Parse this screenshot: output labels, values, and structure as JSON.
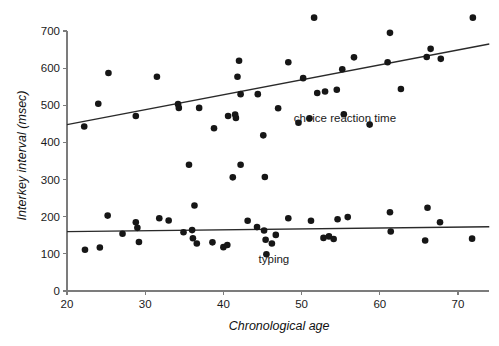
{
  "chart_data": {
    "type": "scatter",
    "title": "",
    "xlabel": "Chronological age",
    "ylabel": "Interkey interval (msec)",
    "xlim": [
      20,
      74
    ],
    "ylim": [
      0,
      730
    ],
    "grid": false,
    "legend_position": "inline-annotation",
    "xticks": [
      20,
      30,
      40,
      50,
      60,
      70
    ],
    "xtick_labels": [
      "20",
      "30",
      "40",
      "50",
      "60",
      "70"
    ],
    "yticks": [
      0,
      100,
      200,
      300,
      400,
      500,
      600,
      700
    ],
    "ytick_labels": [
      "0",
      "100",
      "200",
      "300",
      "400",
      "500",
      "600",
      "700"
    ],
    "annotations": [
      {
        "text": "choice reaction time",
        "x": 49.0,
        "y": 455
      },
      {
        "text": "typing",
        "x": 44.5,
        "y": 75
      }
    ],
    "series": [
      {
        "name": "choice reaction time",
        "label": "choice reaction time",
        "color": "#161616",
        "marker": "circle",
        "trendline": {
          "x0": 20,
          "y0": 448,
          "x1": 74,
          "y1": 665
        },
        "points": [
          {
            "x": 22.2,
            "y": 443
          },
          {
            "x": 24.0,
            "y": 504
          },
          {
            "x": 25.3,
            "y": 587
          },
          {
            "x": 28.8,
            "y": 471
          },
          {
            "x": 31.5,
            "y": 577
          },
          {
            "x": 34.2,
            "y": 503
          },
          {
            "x": 34.3,
            "y": 493
          },
          {
            "x": 36.9,
            "y": 493
          },
          {
            "x": 38.8,
            "y": 438
          },
          {
            "x": 40.6,
            "y": 471
          },
          {
            "x": 41.5,
            "y": 475
          },
          {
            "x": 41.6,
            "y": 466
          },
          {
            "x": 41.8,
            "y": 577
          },
          {
            "x": 42.0,
            "y": 620
          },
          {
            "x": 42.2,
            "y": 530
          },
          {
            "x": 42.2,
            "y": 340
          },
          {
            "x": 44.4,
            "y": 530
          },
          {
            "x": 45.1,
            "y": 419
          },
          {
            "x": 45.3,
            "y": 307
          },
          {
            "x": 47.0,
            "y": 492
          },
          {
            "x": 48.3,
            "y": 616
          },
          {
            "x": 49.6,
            "y": 453
          },
          {
            "x": 50.2,
            "y": 573
          },
          {
            "x": 51.0,
            "y": 465
          },
          {
            "x": 51.6,
            "y": 736
          },
          {
            "x": 52.0,
            "y": 533
          },
          {
            "x": 53.0,
            "y": 537
          },
          {
            "x": 54.5,
            "y": 542
          },
          {
            "x": 55.2,
            "y": 597
          },
          {
            "x": 55.4,
            "y": 476
          },
          {
            "x": 56.7,
            "y": 629
          },
          {
            "x": 58.7,
            "y": 448
          },
          {
            "x": 61.0,
            "y": 616
          },
          {
            "x": 61.3,
            "y": 695
          },
          {
            "x": 62.7,
            "y": 544
          },
          {
            "x": 66.0,
            "y": 630
          },
          {
            "x": 66.5,
            "y": 652
          },
          {
            "x": 67.8,
            "y": 625
          },
          {
            "x": 71.9,
            "y": 736
          }
        ]
      },
      {
        "name": "typing",
        "label": "typing",
        "color": "#161616",
        "marker": "circle",
        "trendline": {
          "x0": 20,
          "y0": 160,
          "x1": 74,
          "y1": 173
        },
        "points": [
          {
            "x": 22.3,
            "y": 111
          },
          {
            "x": 24.2,
            "y": 117
          },
          {
            "x": 25.2,
            "y": 203
          },
          {
            "x": 27.1,
            "y": 154
          },
          {
            "x": 28.8,
            "y": 185
          },
          {
            "x": 29.0,
            "y": 170
          },
          {
            "x": 29.2,
            "y": 132
          },
          {
            "x": 31.8,
            "y": 196
          },
          {
            "x": 33.0,
            "y": 190
          },
          {
            "x": 34.9,
            "y": 158
          },
          {
            "x": 35.6,
            "y": 340
          },
          {
            "x": 36.0,
            "y": 164
          },
          {
            "x": 36.1,
            "y": 142
          },
          {
            "x": 36.3,
            "y": 230
          },
          {
            "x": 36.6,
            "y": 128
          },
          {
            "x": 38.6,
            "y": 131
          },
          {
            "x": 40.0,
            "y": 118
          },
          {
            "x": 40.5,
            "y": 124
          },
          {
            "x": 41.2,
            "y": 306
          },
          {
            "x": 43.1,
            "y": 189
          },
          {
            "x": 44.3,
            "y": 172
          },
          {
            "x": 45.2,
            "y": 163
          },
          {
            "x": 45.4,
            "y": 138
          },
          {
            "x": 45.5,
            "y": 99
          },
          {
            "x": 46.2,
            "y": 128
          },
          {
            "x": 46.7,
            "y": 151
          },
          {
            "x": 48.3,
            "y": 196
          },
          {
            "x": 51.2,
            "y": 189
          },
          {
            "x": 52.8,
            "y": 143
          },
          {
            "x": 53.5,
            "y": 147
          },
          {
            "x": 54.1,
            "y": 140
          },
          {
            "x": 54.6,
            "y": 193
          },
          {
            "x": 55.9,
            "y": 199
          },
          {
            "x": 61.3,
            "y": 212
          },
          {
            "x": 61.4,
            "y": 160
          },
          {
            "x": 65.8,
            "y": 136
          },
          {
            "x": 66.1,
            "y": 224
          },
          {
            "x": 67.7,
            "y": 185
          },
          {
            "x": 71.8,
            "y": 141
          }
        ]
      }
    ]
  }
}
